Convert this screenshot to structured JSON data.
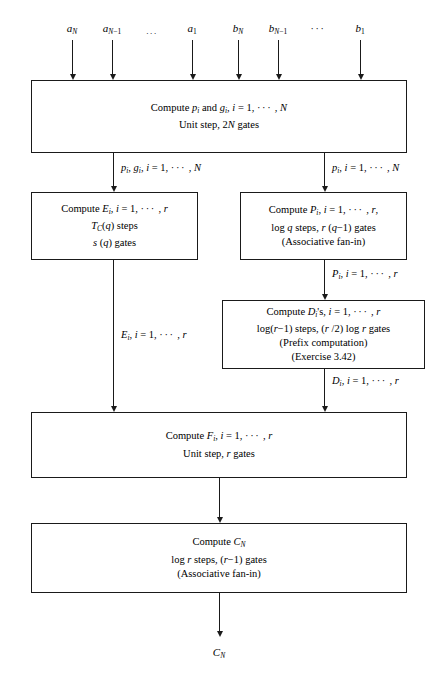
{
  "diagram": {
    "inputs": [
      {
        "id": "a-N",
        "label": "aN",
        "base": "a",
        "sub": "N",
        "x": 72
      },
      {
        "id": "a-N-1",
        "label": "aN−1",
        "base": "a",
        "sub": "N−1",
        "x": 112
      },
      {
        "id": "a-dots",
        "label": "...",
        "base": "",
        "sub": "",
        "x": 152
      },
      {
        "id": "a-1",
        "label": "a1",
        "base": "a",
        "sub": "1",
        "x": 192
      },
      {
        "id": "b-N",
        "label": "bN",
        "base": "b",
        "sub": "N",
        "x": 238
      },
      {
        "id": "b-N-1",
        "label": "bN−1",
        "base": "b",
        "sub": "N−1",
        "x": 278
      },
      {
        "id": "b-dots",
        "label": "···",
        "base": "",
        "sub": "",
        "x": 318
      },
      {
        "id": "b-1",
        "label": "b1",
        "base": "b",
        "sub": "1",
        "x": 360
      }
    ],
    "boxes": [
      {
        "id": "compute-p-g",
        "lines": [
          "Compute pi and gi, i = 1, ··· , N",
          "Unit step, 2N gates"
        ]
      },
      {
        "id": "compute-e",
        "lines": [
          "Compute Ei, i = 1, ··· , r",
          "TC(q) steps",
          "s (q) gates"
        ]
      },
      {
        "id": "compute-p",
        "lines": [
          "Compute Pi, i = 1, ··· , r,",
          "log q steps, r (q−1) gates",
          "(Associative fan-in)"
        ]
      },
      {
        "id": "compute-d",
        "lines": [
          "Compute Di's, i = 1, ··· , r",
          "log(r−1) steps, (r /2) log r gates",
          "(Prefix computation)",
          "(Exercise 3.42)"
        ]
      },
      {
        "id": "compute-f",
        "lines": [
          "Compute Fi, i = 1, ··· , r",
          "Unit step, r gates"
        ]
      },
      {
        "id": "compute-c",
        "lines": [
          "Compute CN",
          "log r steps, (r−1) gates",
          "(Associative fan-in)"
        ]
      }
    ],
    "edge_labels": [
      {
        "id": "edge-p-g",
        "text": "pi, gi, i = 1, ··· , N"
      },
      {
        "id": "edge-p",
        "text": "pi, i = 1, ··· , N"
      },
      {
        "id": "edge-pbig",
        "text": "Pi, i = 1, ··· , r"
      },
      {
        "id": "edge-e",
        "text": "Ei, i = 1, ··· , r"
      },
      {
        "id": "edge-d",
        "text": "Di, i = 1, ··· , r"
      }
    ],
    "output": {
      "id": "output-cn",
      "label": "CN"
    },
    "colors": {
      "stroke": "#1a1a1a",
      "background": "#ffffff",
      "text": "#000000"
    }
  }
}
